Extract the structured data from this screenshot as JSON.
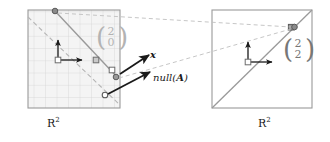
{
  "figure": {
    "type": "linear-algebra-diagram",
    "domain_space_label": "R",
    "domain_space_exponent": "2",
    "codomain_space_label": "R",
    "codomain_space_exponent": "2",
    "vector_label": "x",
    "nullspace_label": "null(",
    "nullspace_label_bold": "A",
    "nullspace_label_close": ")",
    "left_vector": {
      "top": "2",
      "bottom": "0"
    },
    "right_vector": {
      "top": "2",
      "bottom": "2"
    },
    "colors": {
      "grid_line": "#cccccc",
      "grid_fill": "#f2f2f2",
      "frame": "#999999",
      "solid_map_line": "#999999",
      "dashed_null_line": "#b3b3b3",
      "dashed_correspondence": "#bbbbbb",
      "point_outline": "#666666",
      "point_fill": "#ffffff",
      "point_fill_dark": "#808080",
      "axis_arrow": "#1a1a1a",
      "label_text": "#1a1a1a",
      "vector_text_left": "#b3b3b3",
      "vector_text_right": "#777777"
    },
    "left_panel": {
      "x": 28,
      "y": 10,
      "width": 92,
      "height": 98,
      "grid_rows": 8,
      "grid_cols": 8,
      "origin": {
        "x": 58,
        "y": 60
      }
    },
    "right_panel": {
      "x": 212,
      "y": 10,
      "width": 100,
      "height": 98,
      "origin": {
        "x": 248,
        "y": 62
      }
    },
    "points": {
      "left_top": {
        "x": 55,
        "y": 11
      },
      "left_mid_square": {
        "x": 96,
        "y": 60
      },
      "left_lower_a": {
        "x": 112,
        "y": 70
      },
      "left_lower_b": {
        "x": 116,
        "y": 77
      },
      "left_bottom": {
        "x": 105,
        "y": 95
      },
      "right_image": {
        "x": 292,
        "y": 27
      }
    },
    "annotations": {
      "x_arrow_from": {
        "x": 120,
        "y": 72
      },
      "x_arrow_to": {
        "x": 148,
        "y": 55
      },
      "null_arrow_from": {
        "x": 110,
        "y": 93
      },
      "null_arrow_to": {
        "x": 150,
        "y": 73
      }
    }
  }
}
